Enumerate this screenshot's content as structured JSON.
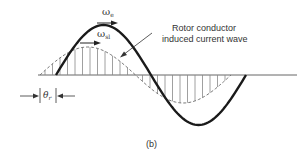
{
  "diagram": {
    "caption": "(b)",
    "labels": {
      "omega_e": {
        "symbol": "ω",
        "subscript": "e"
      },
      "omega_sl": {
        "symbol": "ω",
        "subscript": "sl"
      },
      "theta_r": {
        "symbol": "θ",
        "subscript": "r"
      },
      "rotor_line1": "Rotor conductor",
      "rotor_line2": "induced current wave"
    },
    "curves": [
      {
        "name": "field-wave",
        "style": "solid-bold",
        "amplitude_px": 50,
        "start_x": 56,
        "end_x": 246
      },
      {
        "name": "rotor-induced-current-wave",
        "style": "dashed-hatched",
        "amplitude_px": 28,
        "start_x": 40,
        "end_x": 231
      }
    ],
    "colors": {
      "ink": "#222222",
      "hatch": "#777777",
      "axis": "#555555"
    }
  }
}
